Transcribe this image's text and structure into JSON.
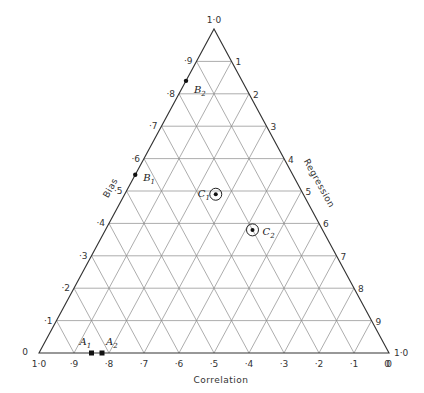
{
  "chart_data": {
    "type": "ternary",
    "axes": {
      "bottom": {
        "label": "Correlation",
        "ticks": [
          "1·0",
          "·9",
          "·8",
          "·7",
          "·6",
          "·5",
          "·4",
          "·3",
          "·2",
          "·1",
          "0"
        ]
      },
      "left": {
        "label": "Bias",
        "ticks": [
          "0",
          "·1",
          "·2",
          "·3",
          "·4",
          "·5",
          "·6",
          "·7",
          "·8",
          "·9",
          "1·0"
        ]
      },
      "right": {
        "label": "Regression",
        "ticks": [
          "0",
          "1",
          "2",
          "3",
          "4",
          "5",
          "6",
          "7",
          "8",
          "9",
          "1·0"
        ]
      }
    },
    "apex_label": "1·0",
    "grid_step": 0.1,
    "points": [
      {
        "name": "A",
        "sub": "1",
        "correlation": 0.85,
        "bias": 0.0,
        "regression": 0.15,
        "marker": "square"
      },
      {
        "name": "A",
        "sub": "2",
        "correlation": 0.82,
        "bias": 0.0,
        "regression": 0.18,
        "marker": "square"
      },
      {
        "name": "B",
        "sub": "1",
        "correlation": 0.45,
        "bias": 0.55,
        "regression": 0.0,
        "marker": "dot"
      },
      {
        "name": "B",
        "sub": "2",
        "correlation": 0.16,
        "bias": 0.84,
        "regression": 0.0,
        "marker": "dot"
      },
      {
        "name": "C",
        "sub": "1",
        "correlation": 0.25,
        "bias": 0.49,
        "regression": 0.26,
        "marker": "circled-dot"
      },
      {
        "name": "C",
        "sub": "2",
        "correlation": 0.2,
        "bias": 0.38,
        "regression": 0.42,
        "marker": "circled-dot"
      }
    ]
  }
}
